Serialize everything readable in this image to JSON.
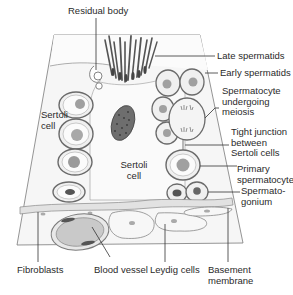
{
  "diagram": {
    "labels": {
      "residual_body": "Residual body",
      "late_spermatids": "Late spermatids",
      "early_spermatids": "Early spermatids",
      "spermatocyte_meiosis": "Spermatocyte\nundergoing\nmeiosis",
      "tight_junction": "Tight junction\nbetween\nSertoli cells",
      "primary_spermatocyte": "Primary\nspermatocyte",
      "spermatogonium": "Spermato-\ngonium",
      "sertoli_cell_left": "Sertoli\ncell",
      "sertoli_cell_center": "Sertoli\ncell",
      "fibroblasts": "Fibroblasts",
      "blood_vessel": "Blood vessel",
      "leydig_cells": "Leydig cells",
      "basement_membrane": "Basement\nmembrane"
    },
    "colors": {
      "background": "#ffffff",
      "tissue": "#f4f4f4",
      "outline": "#6a6a6a",
      "nucleus": "#9a9a9a",
      "dark_nucleus": "#555555",
      "leader_line": "#333333",
      "text": "#2a2a2a"
    }
  }
}
